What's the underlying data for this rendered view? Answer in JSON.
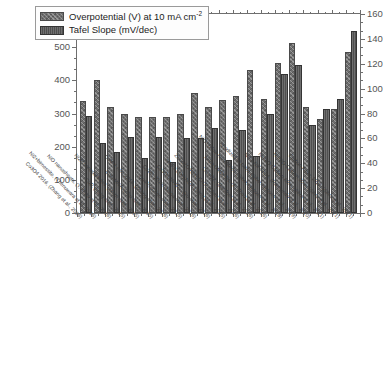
{
  "chart_data": {
    "type": "bar",
    "title": "",
    "xlabel": "",
    "ylabel": "",
    "grid": false,
    "legend_position": "top-left",
    "axes": {
      "left": {
        "label": "Overpotential (mV) at 10 mA cm-2",
        "min": 0,
        "max": 600,
        "tick_step": 100,
        "minor_ticks_per_interval": 2,
        "ticks": [
          0,
          100,
          200,
          300,
          400,
          500,
          600
        ]
      },
      "right": {
        "label": "Tafel Slope (mV/dec)",
        "min": 0,
        "max": 160,
        "tick_step": 20,
        "minor_ticks_per_interval": 2,
        "ticks": [
          0,
          20,
          40,
          60,
          80,
          100,
          120,
          140,
          160
        ]
      }
    },
    "categories": [
      "Co3O4 2016, (Zhang et al., 2016)",
      "Ni2+birnessite, (Thenuwara et al., 2016)",
      "NiO nanosheets, (Y. Zhao et al., 2016)",
      "CoP, (Yang et al., 2015)",
      "Ni2P nanoparticles, (Stern et al., 2015)",
      "CoP-MNA, (Zhu et al., 2015)",
      "CoM-1 min, 2016, (Zhang et al., 2016)",
      "Co4N, (Chen et al., 2015)",
      "Co2B, 2016, (Masa et al., 2016)",
      "Co3O4 NWCC, (Yu et al., 2016)",
      "nNiFe LDH:NGF, (Tang et al., 2015)",
      "ZnCo2O4@N-CNT, (Chen et al., 2016)",
      "LiCoO2, (Gardner et al., 2016)",
      "NiCo-UMOFNs, (S. Zhao et al., 2016)",
      "NiO hollow nanofibres, (Silva, Simoes et al., 2018)",
      "Anodized Ni foam, (Silva, Simoes et al., 2019)",
      "NiFe-NiFe2O4, (Raimundo et al., 2020)",
      "Ni-NiO-Carbon 60%, (Silva et al., 2021)",
      "Ni-NiO-Carbon 30%, (Silva et al., 2021)",
      "Carbon Fiber, 2021, (Silva et al., 2021)"
    ],
    "series": [
      {
        "name": "Overpotential (V) at 10 mA cm-2",
        "axis": "left",
        "unit": "mV",
        "values": [
          338,
          400,
          320,
          300,
          290,
          291,
          291,
          300,
          362,
          320,
          340,
          353,
          432,
          343,
          453,
          512,
          320,
          283,
          313,
          484
        ]
      },
      {
        "name": "Tafel Slope (mV/dec)",
        "axis": "right",
        "unit": "mV/dec",
        "values": [
          78,
          56,
          49,
          61,
          44,
          61,
          41,
          60,
          60,
          68,
          43,
          67,
          46,
          80,
          112,
          119,
          71,
          84,
          92,
          146
        ]
      }
    ]
  },
  "legend": {
    "entries": [
      {
        "label_main": "Overpotential (V) at 10 mA cm",
        "label_sup": "-2",
        "swatch": "series-1-swatch"
      },
      {
        "label_main": "Tafel Slope (mV/dec)",
        "label_sup": "",
        "swatch": "series-2-swatch"
      }
    ]
  },
  "colors": {
    "series_1": "#6f6f6f",
    "series_2": "#4f4f4f",
    "axis": "#6e6e6e",
    "tick_text": "#555555",
    "category_text": "#3a3a3a",
    "background": "#ffffff"
  }
}
